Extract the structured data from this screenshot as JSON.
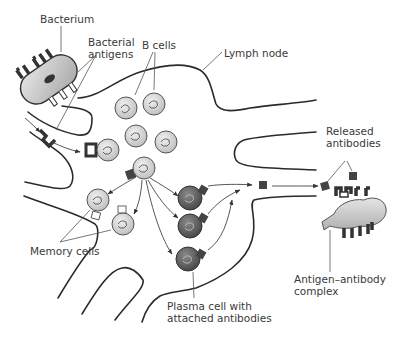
{
  "figure": {
    "labels": {
      "bacterium": "Bacterium",
      "bacterial_antigens_line1": "Bacterial",
      "bacterial_antigens_line2": "antigens",
      "b_cells": "B cells",
      "lymph_node": "Lymph node",
      "released_antibodies_line1": "Released",
      "released_antibodies_line2": "antibodies",
      "memory_cells": "Memory cells",
      "plasma_cell_line1": "Plasma cell with",
      "plasma_cell_line2": "attached antibodies",
      "complex_line1": "Antigen–antibody",
      "complex_line2": "complex"
    },
    "colors": {
      "line": "#2a2a2a",
      "b_cell_fill": "#d9d9d9",
      "plasma_cell_fill": "#6a6a6a",
      "bacterium_fill": "#c8c8c8",
      "antibody": "#3a3a3a"
    },
    "elements": {
      "b_cells_count": 6,
      "memory_cells_count": 2,
      "plasma_cells_count": 3,
      "released_antibodies_count": 3
    }
  }
}
